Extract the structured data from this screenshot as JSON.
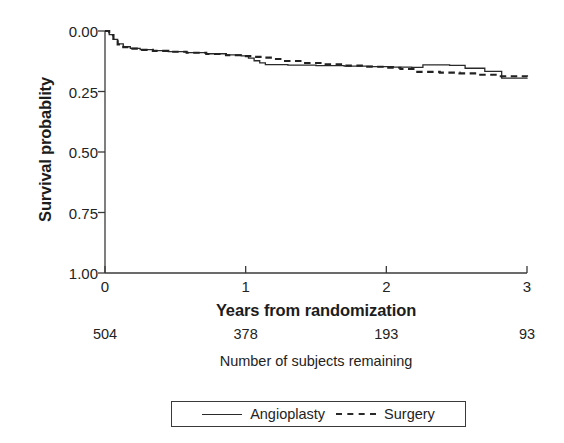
{
  "axes": {
    "y_title": "Survival probablity",
    "x_title": "Years from randomization",
    "y_ticks": [
      "1.00",
      "0.75",
      "0.50",
      "0.25",
      "0.00"
    ],
    "x_ticks": [
      "0",
      "1",
      "2",
      "3"
    ]
  },
  "risk_table": {
    "caption": "Number of subjects remaining",
    "values": [
      "504",
      "378",
      "193",
      "93"
    ]
  },
  "legend": {
    "angioplasty_label": "Angioplasty",
    "surgery_label": "Surgery"
  },
  "colors": {
    "ink": "#2a2a2a",
    "text": "#232323",
    "background": "#ffffff"
  },
  "chart_data": {
    "type": "line",
    "title": "",
    "subtitle": "",
    "xlabel": "Years from randomization",
    "ylabel": "Survival probablity",
    "xlim": [
      0,
      3
    ],
    "ylim": [
      0.0,
      1.0
    ],
    "xticks": [
      0,
      1,
      2,
      3
    ],
    "yticks": [
      0.0,
      0.25,
      0.5,
      0.75,
      1.0
    ],
    "grid": false,
    "legend_position": "bottom",
    "step_type": "post",
    "annotations": [
      "Number at risk shown below x-axis: 504 (0 yr), 378 (1 yr), 193 (2 yr), 93 (3 yr)"
    ],
    "series": [
      {
        "name": "Angioplasty",
        "style": "solid",
        "x": [
          0.0,
          0.03,
          0.06,
          0.09,
          0.13,
          0.18,
          0.25,
          0.34,
          0.45,
          0.58,
          0.72,
          0.86,
          0.97,
          1.02,
          1.06,
          1.1,
          1.14,
          1.3,
          1.5,
          1.7,
          1.9,
          2.05,
          2.18,
          2.26,
          2.45,
          2.56,
          2.7,
          2.82,
          3.0
        ],
        "y": [
          1.0,
          0.985,
          0.965,
          0.947,
          0.935,
          0.928,
          0.923,
          0.919,
          0.915,
          0.911,
          0.906,
          0.901,
          0.897,
          0.888,
          0.877,
          0.868,
          0.861,
          0.859,
          0.857,
          0.855,
          0.853,
          0.851,
          0.85,
          0.86,
          0.858,
          0.846,
          0.833,
          0.805,
          0.803
        ]
      },
      {
        "name": "Surgery",
        "style": "dashed",
        "x": [
          0.0,
          0.03,
          0.06,
          0.09,
          0.13,
          0.18,
          0.25,
          0.34,
          0.45,
          0.58,
          0.72,
          0.86,
          0.97,
          1.05,
          1.12,
          1.2,
          1.28,
          1.4,
          1.55,
          1.7,
          1.85,
          2.0,
          2.1,
          2.22,
          2.38,
          2.52,
          2.66,
          2.8,
          3.0
        ],
        "y": [
          1.0,
          0.983,
          0.962,
          0.944,
          0.933,
          0.927,
          0.922,
          0.918,
          0.914,
          0.91,
          0.905,
          0.9,
          0.896,
          0.893,
          0.89,
          0.884,
          0.876,
          0.868,
          0.862,
          0.857,
          0.852,
          0.848,
          0.843,
          0.831,
          0.828,
          0.825,
          0.819,
          0.813,
          0.811
        ]
      }
    ]
  }
}
